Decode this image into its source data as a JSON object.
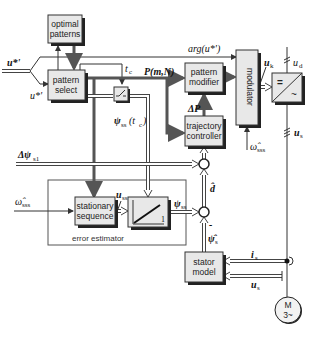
{
  "diagram": {
    "blocks": {
      "optimal_patterns": [
        "optimal",
        "patterns"
      ],
      "pattern_select": [
        "pattern",
        "select"
      ],
      "pattern_modifier": [
        "pattern",
        "modifier"
      ],
      "trajectory_controller": [
        "trajectory",
        "controller"
      ],
      "modulator": "modulator",
      "stationary_sequence": [
        "stationary",
        "sequence"
      ],
      "integrator_label": "1",
      "stator_model": [
        "stator",
        "model"
      ],
      "motor": [
        "M",
        "3~"
      ],
      "converter_top": "=",
      "converter_bottom": "~"
    },
    "group_label": "error estimator",
    "signals": {
      "u_ref_top": "u*'",
      "u_ref_bottom": "u*'",
      "arg_u": "arg(u*')",
      "t_c": "t",
      "t_c_sub": "c",
      "p_mn": "P(m,N)",
      "delta_p": "ΔP",
      "psi_ss_tc": "ψ",
      "psi_ss_tc_sub": "ss",
      "psi_ss_tc_arg": "(t",
      "psi_ss_tc_arg_sub": "c",
      "psi_ss_tc_close": ")",
      "delta_psi_s1": "Δψ",
      "delta_psi_s1_sub": "s1",
      "omega_sss_left": "ω̂",
      "omega_sss_left_sub": "sss",
      "omega_sss_right": "ω̂",
      "omega_sss_right_sub": "sss",
      "u_ss": "u",
      "u_ss_sub": "ss",
      "psi_ss": "ψ",
      "psi_ss_sub": "ss",
      "d_hat": "d̂",
      "psi_s_hat": "ψ̂",
      "psi_s_hat_sub": "s",
      "minus_sign": "-",
      "u_k": "u",
      "u_k_sub": "k",
      "u_d": "u",
      "u_d_sub": "d",
      "u_s_right": "u",
      "u_s_right_sub": "s",
      "i_s": "i",
      "i_s_sub": "s",
      "u_s_bottom": "u",
      "u_s_bottom_sub": "s"
    }
  }
}
